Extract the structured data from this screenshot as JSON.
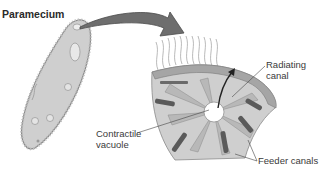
{
  "diagram": {
    "title": "Paramecium",
    "labels": {
      "radiating_canal_line1": "Radiating",
      "radiating_canal_line2": "canal",
      "contractile_vacuole_line1": "Contractile",
      "contractile_vacuole_line2": "vacuole",
      "feeder_canals": "Feeder canals"
    },
    "colors": {
      "organism_fill": "#c8c8c8",
      "arrow_fill": "#6e6e6e",
      "vacuole_fill": "#b4b4b4",
      "canal_fill": "#5a5a5a",
      "text": "#3a3a3a"
    }
  }
}
